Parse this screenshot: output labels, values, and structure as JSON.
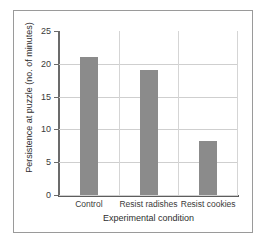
{
  "chart_data": {
    "type": "bar",
    "title": "",
    "categories": [
      "Control",
      "Resist radishes",
      "Resist cookies"
    ],
    "values": [
      21,
      19,
      8.2
    ],
    "xlabel": "Experimental condition",
    "ylabel": "Persistence at puzzle (no. of minutes)",
    "ylim": [
      0,
      25
    ],
    "yticks": [
      0,
      5,
      10,
      15,
      20,
      25
    ],
    "ytick_labels": [
      "0",
      "5",
      "10",
      "15",
      "20",
      "25"
    ],
    "grid": true,
    "legend": false,
    "bar_color": "#8b8b8b",
    "gridline_color": "#cfcfcf",
    "axis_color": "#5d5d5d",
    "background_color": "#ffffff",
    "frame_color": "#9a9a9a"
  }
}
